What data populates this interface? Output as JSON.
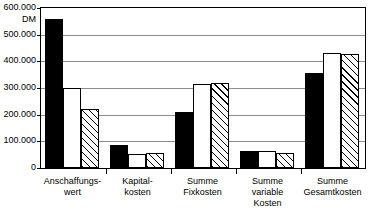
{
  "chart_data": {
    "type": "bar",
    "title": "",
    "xlabel": "",
    "ylabel": "DM",
    "unit": "DM",
    "ylim": [
      0,
      600000
    ],
    "grid": true,
    "legend": "none",
    "ytick_labels": [
      "600.000",
      "500.000",
      "400.000",
      "300.000",
      "200.000",
      "100.000",
      "0"
    ],
    "ytick_values": [
      600000,
      500000,
      400000,
      300000,
      200000,
      100000,
      0
    ],
    "categories": [
      "Anschaffungs-\nwert",
      "Kapital-\nkosten",
      "Summe\nFixkosten",
      "Summe\nvariable\nKosten",
      "Summe\nGesamtkosten"
    ],
    "category_lines": [
      [
        "Anschaffungs-",
        "wert"
      ],
      [
        "Kapital-",
        "kosten"
      ],
      [
        "Summe",
        "Fixkosten"
      ],
      [
        "Summe",
        "variable",
        "Kosten"
      ],
      [
        "Summe",
        "Gesamtkosten"
      ]
    ],
    "series": [
      {
        "name": "series-1",
        "style": "solid-black",
        "color": "#000000",
        "values": [
          560000,
          85000,
          210000,
          62000,
          357000
        ]
      },
      {
        "name": "series-2",
        "style": "open-white",
        "color": "#ffffff",
        "values": [
          300000,
          52000,
          315000,
          63000,
          430000
        ]
      },
      {
        "name": "series-3",
        "style": "diagonal-hatch",
        "color": "#ffffff",
        "values": [
          220000,
          57000,
          318000,
          55000,
          426000
        ]
      }
    ]
  }
}
